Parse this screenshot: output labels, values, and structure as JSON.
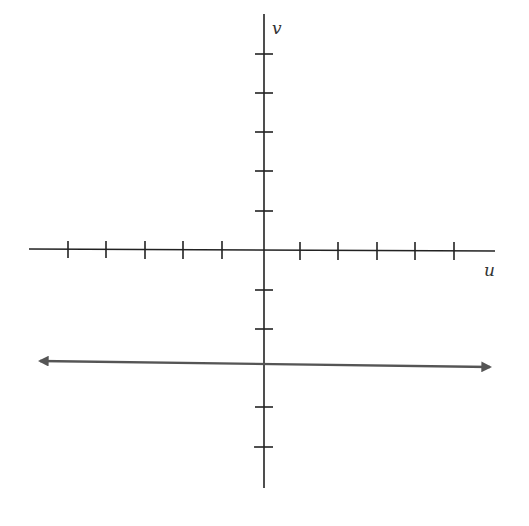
{
  "diagram": {
    "type": "coordinate-plane",
    "axes": {
      "horizontal_label": "u",
      "vertical_label": "v",
      "horizontal_ticks_each_side": 5,
      "vertical_ticks_above": 5,
      "vertical_ticks_below": 5
    },
    "line": {
      "description": "horizontal line with arrows at both ends, through v = -3",
      "v": -3,
      "color": "#555555"
    },
    "colors": {
      "axis": "#222222",
      "line": "#555555"
    }
  }
}
